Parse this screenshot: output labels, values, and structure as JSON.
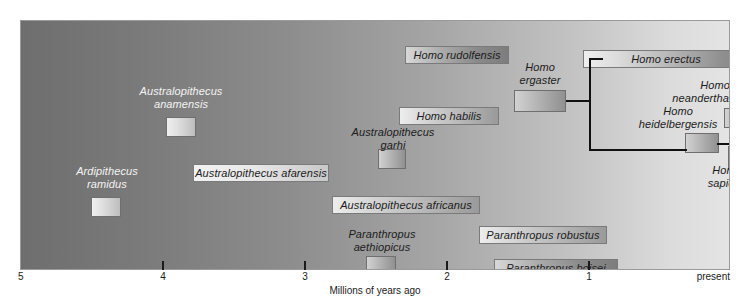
{
  "figure": {
    "kind": "hominin-phylogeny-timeline"
  },
  "axis": {
    "title": "Millions of years ago",
    "ticks": [
      {
        "label": "5",
        "value": 5,
        "x": 0
      },
      {
        "label": "4",
        "value": 4,
        "x": 142
      },
      {
        "label": "3",
        "value": 3,
        "x": 284
      },
      {
        "label": "2",
        "value": 2,
        "x": 426
      },
      {
        "label": "1",
        "value": 1,
        "x": 568
      },
      {
        "label": "present",
        "value": 0,
        "x": 710
      }
    ]
  },
  "taxa": [
    {
      "name": "Ardipithecus ramidus",
      "label_lines": [
        "Ardipithecus",
        "ramidus"
      ],
      "style": "stub-outside-label",
      "label_color": "on-dark",
      "bar": {
        "x": 70,
        "y": 176,
        "w": 30,
        "h": 20
      },
      "label_box": {
        "x": 48,
        "y": 144,
        "w": 76,
        "h": 28
      }
    },
    {
      "name": "Australopithecus anamensis",
      "label_lines": [
        "Australopithecus",
        "anamensis"
      ],
      "style": "stub-outside-label",
      "label_color": "on-dark",
      "bar": {
        "x": 145,
        "y": 96,
        "w": 30,
        "h": 20
      },
      "label_box": {
        "x": 108,
        "y": 64,
        "w": 104,
        "h": 28
      }
    },
    {
      "name": "Australopithecus afarensis",
      "label_lines": [
        "Australopithecus afarensis"
      ],
      "style": "boxed-bar",
      "gradient": "g-light",
      "bar": {
        "x": 172,
        "y": 143,
        "w": 136,
        "h": 18
      }
    },
    {
      "name": "Australopithecus garhi",
      "label_lines": [
        "Australopithecus",
        "garhi"
      ],
      "style": "stub-outside-label",
      "label_color": "on-light",
      "bar": {
        "x": 357,
        "y": 128,
        "w": 28,
        "h": 20
      },
      "label_box": {
        "x": 320,
        "y": 105,
        "w": 104,
        "h": 28
      }
    },
    {
      "name": "Australopithecus africanus",
      "label_lines": [
        "Australopithecus africanus"
      ],
      "style": "boxed-bar",
      "gradient": "g-mid",
      "bar": {
        "x": 311,
        "y": 175,
        "w": 148,
        "h": 18
      }
    },
    {
      "name": "Paranthropus aethiopicus",
      "label_lines": [
        "Paranthropus",
        "aethiopicus"
      ],
      "style": "stub-outside-label",
      "label_color": "on-light",
      "bar": {
        "x": 345,
        "y": 235,
        "w": 30,
        "h": 20
      },
      "label_box": {
        "x": 318,
        "y": 207,
        "w": 86,
        "h": 28
      }
    },
    {
      "name": "Paranthropus robustus",
      "label_lines": [
        "Paranthropus robustus"
      ],
      "style": "boxed-bar",
      "gradient": "g-mid",
      "bar": {
        "x": 458,
        "y": 205,
        "w": 128,
        "h": 18
      }
    },
    {
      "name": "Paranthropus boisei",
      "label_lines": [
        "Paranthropus boisei"
      ],
      "style": "boxed-bar",
      "gradient": "g-dark",
      "bar": {
        "x": 473,
        "y": 238,
        "w": 124,
        "h": 18
      }
    },
    {
      "name": "Homo rudolfensis",
      "label_lines": [
        "Homo rudolfensis"
      ],
      "style": "boxed-bar",
      "gradient": "g-dark",
      "bar": {
        "x": 384,
        "y": 25,
        "w": 104,
        "h": 18
      }
    },
    {
      "name": "Homo habilis",
      "label_lines": [
        "Homo habilis"
      ],
      "style": "boxed-bar",
      "gradient": "g-mid",
      "bar": {
        "x": 378,
        "y": 86,
        "w": 100,
        "h": 18
      }
    },
    {
      "name": "Homo ergaster",
      "label_lines": [
        "Homo",
        "ergaster"
      ],
      "style": "stub-outside-label",
      "label_color": "on-light",
      "bar": {
        "x": 493,
        "y": 69,
        "w": 52,
        "h": 22
      },
      "label_box": {
        "x": 487,
        "y": 40,
        "w": 64,
        "h": 28
      }
    },
    {
      "name": "Homo erectus",
      "label_lines": [
        "Homo erectus"
      ],
      "style": "boxed-bar",
      "gradient": "g-erectus",
      "bar": {
        "x": 562,
        "y": 29,
        "w": 166,
        "h": 18
      }
    },
    {
      "name": "Homo heidelbergensis",
      "label_lines": [
        "Homo",
        "heidelbergensis"
      ],
      "style": "stub-outside-label",
      "label_color": "on-light",
      "bar": {
        "x": 664,
        "y": 112,
        "w": 34,
        "h": 20
      },
      "label_box": {
        "x": 610,
        "y": 84,
        "w": 94,
        "h": 28
      }
    },
    {
      "name": "Homo neanderthalensis",
      "label_lines": [
        "Homo",
        "neanderthalensis"
      ],
      "style": "stub-outside-label",
      "label_color": "on-light",
      "bar": {
        "x": 703,
        "y": 87,
        "w": 34,
        "h": 20
      },
      "label_box": {
        "x": 638,
        "y": 58,
        "w": 112,
        "h": 28
      }
    },
    {
      "name": "Homo sapiens",
      "label_lines": [
        "Homo",
        "sapiens"
      ],
      "style": "stub-outside-label",
      "label_color": "on-light",
      "bar": {
        "x": 707,
        "y": 125,
        "w": 26,
        "h": 24
      },
      "label_box": {
        "x": 676,
        "y": 143,
        "w": 60,
        "h": 28
      }
    }
  ],
  "branches": [
    {
      "id": "ergaster-to-node",
      "orientation": "h",
      "x": 545,
      "y": 79,
      "length": 25
    },
    {
      "id": "node-vertical",
      "orientation": "v",
      "x": 568,
      "y": 37,
      "length": 93
    },
    {
      "id": "node-to-erectus",
      "orientation": "h",
      "x": 568,
      "y": 37,
      "length": 14
    },
    {
      "id": "node-to-heidelbergensis",
      "orientation": "h",
      "x": 568,
      "y": 128,
      "length": 98
    },
    {
      "id": "heidelbergensis-to-split",
      "orientation": "h",
      "x": 696,
      "y": 122,
      "length": 22
    },
    {
      "id": "split-vertical",
      "orientation": "v",
      "x": 716,
      "y": 96,
      "length": 42
    },
    {
      "id": "split-to-neanderthal",
      "orientation": "h",
      "x": 716,
      "y": 96,
      "length": 12
    },
    {
      "id": "split-to-sapiens",
      "orientation": "h",
      "x": 716,
      "y": 136,
      "length": 12
    }
  ]
}
